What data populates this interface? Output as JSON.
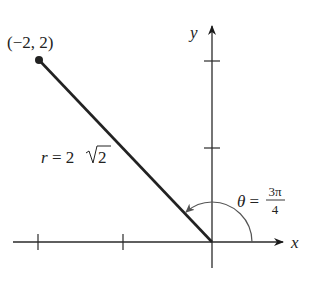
{
  "figure": {
    "point_label": "(−2, 2)",
    "radius_label_prefix": "r = 2",
    "radius_label_radicand": "2",
    "angle_label_lhs": "θ =",
    "angle_label_num": "3π",
    "angle_label_den": "4",
    "x_axis_label": "x",
    "y_axis_label": "y"
  },
  "colors": {
    "axis": "#2a2a2a",
    "segment": "#222222",
    "arc": "#555555",
    "text": "#222222"
  },
  "geometry": {
    "point": {
      "x": -2,
      "y": 2
    },
    "r": "2√2",
    "theta": "3π/4",
    "x_ticks": [
      -2,
      -1
    ],
    "y_ticks": [
      1,
      2
    ]
  }
}
